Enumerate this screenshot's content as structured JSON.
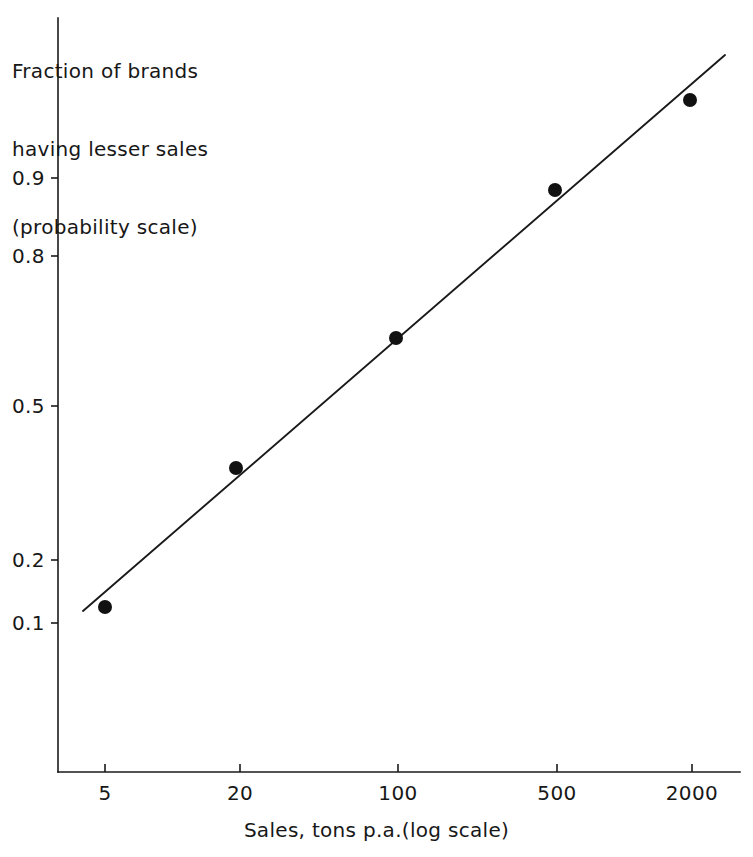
{
  "figure": {
    "background_color": "#ffffff",
    "ink_color": "#1a1a1a"
  },
  "axis_labels": {
    "y_title_lines": [
      "Fraction of brands",
      "having lesser sales",
      "(probability scale)"
    ],
    "x_title": "Sales, tons p.a.(log scale)"
  },
  "chart_data": {
    "type": "scatter",
    "title": "",
    "subtitle": "",
    "xlabel": "Sales, tons p.a.(log scale)",
    "ylabel": "Fraction of brands having lesser sales (probability scale)",
    "x_scale": "log",
    "y_scale": "probability",
    "grid": false,
    "legend": "none",
    "x_tick_labels": [
      "5",
      "20",
      "100",
      "500",
      "2000"
    ],
    "x_tick_values": [
      5,
      20,
      100,
      500,
      2000
    ],
    "y_tick_labels": [
      "0.9",
      "0.8",
      "0.5",
      "0.2",
      "0.1"
    ],
    "y_tick_values": [
      0.9,
      0.8,
      0.5,
      0.2,
      0.1
    ],
    "xlim": [
      3.5,
      3000
    ],
    "ylim": [
      0.04,
      0.99
    ],
    "series": [
      {
        "name": "Observed brands",
        "marker": "filled-circle",
        "x": [
          5,
          20,
          100,
          500,
          2000
        ],
        "y": [
          0.14,
          0.38,
          0.63,
          0.87,
          0.96
        ]
      },
      {
        "name": "Fitted line",
        "marker": "line",
        "x": [
          3.9,
          2800
        ],
        "y": [
          0.125,
          0.975
        ]
      }
    ],
    "annotations": []
  },
  "geometry": {
    "plot_left": 58,
    "plot_right": 740,
    "plot_bottom": 772,
    "plot_top": 18,
    "x_tick_px": [
      105,
      240,
      398,
      557,
      692
    ],
    "y_tick_px": [
      178,
      256,
      406,
      560,
      623
    ],
    "points_px": [
      {
        "x": 105,
        "y": 607
      },
      {
        "x": 236,
        "y": 468
      },
      {
        "x": 396,
        "y": 338
      },
      {
        "x": 555,
        "y": 190
      },
      {
        "x": 690,
        "y": 100
      }
    ],
    "fit_line_px": {
      "x1": 83,
      "y1": 611,
      "x2": 725,
      "y2": 55
    },
    "marker_radius": 7
  }
}
